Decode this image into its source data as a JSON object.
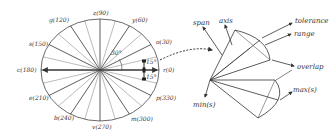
{
  "left_diagram": {
    "title": "direction circle",
    "directions": [
      {
        "label": "r(0)",
        "angle": 0
      },
      {
        "label": "o(30)",
        "angle": 30
      },
      {
        "label": "y(60)",
        "angle": 60
      },
      {
        "label": "z(90)",
        "angle": 90
      },
      {
        "label": "g(120)",
        "angle": 120
      },
      {
        "label": "s(150)",
        "angle": 150
      },
      {
        "label": "c(180)",
        "angle": 180
      },
      {
        "label": "e(210)",
        "angle": 210
      },
      {
        "label": "b(240)",
        "angle": 240
      },
      {
        "label": "v(270)",
        "angle": 270
      },
      {
        "label": "m(300)",
        "angle": 300
      },
      {
        "label": "p(330)",
        "angle": 330
      }
    ],
    "angle_labels": {
      "sector": "30°",
      "half_upper": "15°",
      "half_lower": "15°"
    }
  },
  "right_diagram": {
    "labels": {
      "span": "span",
      "axis": "axis",
      "tolerance": "tolerance",
      "range": "range",
      "overlap": "overlap",
      "max": "max(s)",
      "min": "min(s)"
    }
  },
  "colors": {
    "line": "#333333",
    "background": "#ffffff"
  }
}
